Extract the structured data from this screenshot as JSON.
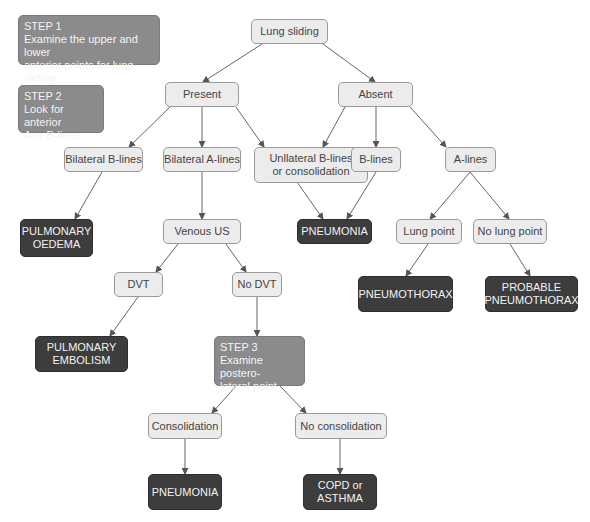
{
  "steps": {
    "step1": {
      "title": "STEP 1",
      "line1": "Examine the upper and lower",
      "line2": "anterior points for lung sliding"
    },
    "step2": {
      "title": "STEP 2",
      "line1": "Look for anterior",
      "line2": "A or B-lines"
    },
    "step3": {
      "title": "STEP 3",
      "line1": "Examine postero-",
      "line2": "lateral point"
    }
  },
  "nodes": {
    "lung_sliding": "Lung sliding",
    "present": "Present",
    "absent": "Absent",
    "bilateral_b_lines": "Bilateral B-lines",
    "bilateral_a_lines": "Bilateral A-lines",
    "unilateral_line1": "Unllateral B-lines",
    "unilateral_line2": "or consolidation",
    "b_lines": "B-lines",
    "a_lines": "A-lines",
    "venous_us": "Venous US",
    "lung_point": "Lung point",
    "no_lung_point": "No lung point",
    "dvt": "DVT",
    "no_dvt": "No DVT",
    "consolidation": "Consolidation",
    "no_consolidation": "No consolidation"
  },
  "diagnoses": {
    "pulmonary_oedema_line1": "PULMONARY",
    "pulmonary_oedema_line2": "OEDEMA",
    "pneumonia_top": "PNEUMONIA",
    "pneumothorax": "PNEUMOTHORAX",
    "probable_pneumothorax_line1": "PROBABLE",
    "probable_pneumothorax_line2": "PNEUMOTHORAX",
    "pulmonary_embolism_line1": "PULMONARY",
    "pulmonary_embolism_line2": "EMBOLISM",
    "pneumonia_bottom": "PNEUMONIA",
    "copd_line1": "COPD or",
    "copd_line2": "ASTHMA"
  },
  "colors": {
    "question_fill": "#ececec",
    "diagnosis_fill": "#3d3d3d",
    "step_fill": "#8b8b8b",
    "edge": "#555555"
  }
}
